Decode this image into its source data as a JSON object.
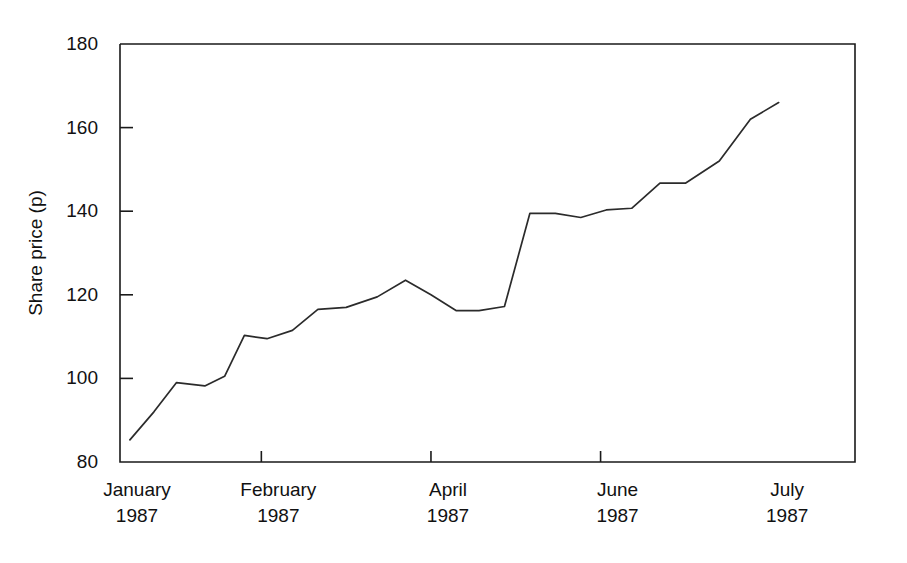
{
  "chart_data": {
    "type": "line",
    "title": "",
    "subtitle": "",
    "xlabel": "",
    "ylabel": "Share price (p)",
    "ylim": [
      80,
      180
    ],
    "xlim": [
      0,
      26
    ],
    "grid": false,
    "legend": null,
    "annotations": [],
    "y_ticks": [
      80,
      100,
      120,
      140,
      160,
      180
    ],
    "y_tick_labels": [
      "80",
      "100",
      "120",
      "140",
      "160",
      "180"
    ],
    "x_ticks": [
      0,
      5,
      11,
      17,
      23
    ],
    "x_tick_labels": [
      {
        "month": "January",
        "year": "1987"
      },
      {
        "month": "February",
        "year": "1987"
      },
      {
        "month": "April",
        "year": "1987"
      },
      {
        "month": "June",
        "year": "1987"
      },
      {
        "month": "July",
        "year": "1987"
      }
    ],
    "series": [
      {
        "name": "Share price",
        "color": "#2b2b2b",
        "x": [
          0.35,
          1.2,
          2.0,
          3.0,
          3.7,
          4.4,
          5.2,
          6.1,
          7.0,
          8.0,
          9.1,
          10.1,
          11.0,
          11.9,
          12.7,
          13.6,
          14.5,
          15.4,
          16.3,
          17.2,
          18.1,
          19.1,
          20.0,
          21.2,
          22.3,
          23.3
        ],
        "y": [
          85.3,
          92.0,
          99.0,
          98.2,
          100.5,
          110.3,
          109.5,
          111.5,
          116.5,
          117.0,
          119.5,
          123.5,
          120.0,
          116.2,
          116.2,
          117.2,
          139.5,
          139.5,
          138.5,
          140.3,
          140.7,
          146.7,
          146.7,
          152.0,
          162.0,
          166.0
        ]
      }
    ]
  },
  "axes": {
    "y_axis_label": "Share price (p)"
  }
}
